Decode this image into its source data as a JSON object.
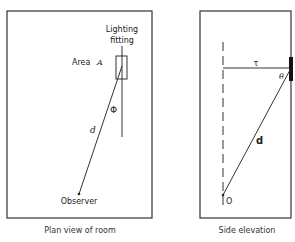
{
  "plan_view": {
    "caption": "Plan view of room",
    "fitting_label_line1": "Lighting",
    "fitting_label_line2": "fitting",
    "area_label": "Area",
    "area_symbol": "A",
    "angle_symbol": "Φ",
    "distance_symbol": "d",
    "observer_label": "Observer"
  },
  "side_elevation": {
    "caption": "Side elevation",
    "horizontal_symbol": "τ",
    "angle_symbol": "θ",
    "distance_symbol": "d",
    "observer_point_label": "O"
  },
  "colors": {
    "line": "#333333",
    "fitting_bar": "#111111"
  }
}
